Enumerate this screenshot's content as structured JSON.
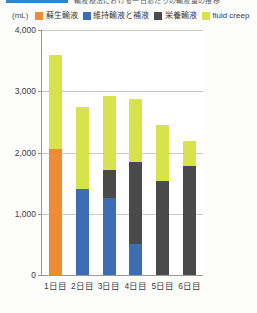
{
  "title": {
    "ribbon_color": "#2f86c8",
    "text": "輸液療法における一日あたりの輸液量の推移"
  },
  "axis": {
    "unit_label": "(mL)",
    "y_ticks": [
      "0",
      "1,000",
      "2,000",
      "3,000",
      "4,000"
    ],
    "x_labels": [
      "1日目",
      "2日目",
      "3日目",
      "4日目",
      "5日目",
      "6日目"
    ]
  },
  "legend": [
    {
      "label": "蘇生輸液",
      "color": "#ef8c31"
    },
    {
      "label": "維持輸液と補液",
      "color": "#3d6eb4"
    },
    {
      "label": "栄養輸液",
      "color": "#4a4a4a"
    },
    {
      "label": "fluid creep",
      "color": "#d7e34a"
    }
  ],
  "chart_data": {
    "type": "bar",
    "title": "輸液療法における一日あたりの輸液量の推移",
    "xlabel": "",
    "ylabel": "(mL)",
    "ylim": [
      0,
      4000
    ],
    "ytick_step": 1000,
    "grid": true,
    "stacked": true,
    "legend_position": "top",
    "categories": [
      "1日目",
      "2日目",
      "3日目",
      "4日目",
      "5日目",
      "6日目"
    ],
    "series": [
      {
        "name": "蘇生輸液",
        "color": "#ef8c31",
        "values": [
          2050,
          0,
          0,
          0,
          0,
          0
        ]
      },
      {
        "name": "維持輸液と補液",
        "color": "#3d6eb4",
        "values": [
          0,
          1400,
          1250,
          500,
          0,
          0
        ]
      },
      {
        "name": "栄養輸液",
        "color": "#4a4a4a",
        "values": [
          0,
          0,
          470,
          1350,
          1530,
          1780
        ]
      },
      {
        "name": "fluid creep",
        "color": "#d7e34a",
        "values": [
          1550,
          1350,
          1200,
          1030,
          920,
          400
        ]
      }
    ],
    "totals": [
      3600,
      2750,
      2920,
      2880,
      2450,
      2180
    ]
  }
}
